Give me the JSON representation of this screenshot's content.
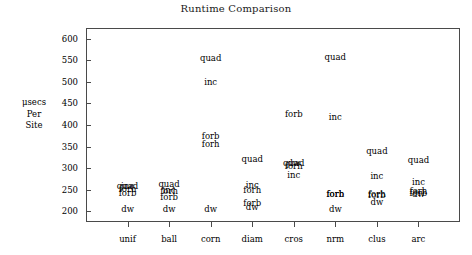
{
  "chart_data": {
    "type": "scatter",
    "title": "Runtime Comparison",
    "xlabel": "",
    "ylabel": "μsecs Per Site",
    "ylabel_lines": [
      "μsecs",
      "Per",
      "Site"
    ],
    "categories": [
      "unif",
      "ball",
      "corn",
      "diam",
      "cros",
      "nrm",
      "clus",
      "arc"
    ],
    "yticks": [
      200,
      250,
      300,
      350,
      400,
      450,
      500,
      550,
      600
    ],
    "ylim": [
      175,
      625
    ],
    "grid": false,
    "legend": "none",
    "marker_style": "text-label",
    "series": [
      {
        "name": "quad",
        "values": [
          258,
          262,
          555,
          320,
          312,
          558,
          340,
          318
        ]
      },
      {
        "name": "inc",
        "values": [
          258,
          250,
          500,
          260,
          285,
          418,
          282,
          268
        ]
      },
      {
        "name": "forb",
        "values": [
          243,
          234,
          375,
          218,
          308,
          240,
          238,
          242
        ]
      },
      {
        "name": "forh",
        "values": [
          252,
          246,
          355,
          250,
          306,
          240,
          240,
          248
        ]
      },
      {
        "name": "dw",
        "values": [
          205,
          204,
          204,
          210,
          312,
          205,
          222,
          240
        ]
      }
    ],
    "points": [
      {
        "category": "unif",
        "series": "quad",
        "value": 258
      },
      {
        "category": "unif",
        "series": "inc",
        "value": 258
      },
      {
        "category": "unif",
        "series": "forh",
        "value": 252
      },
      {
        "category": "unif",
        "series": "forb",
        "value": 243
      },
      {
        "category": "unif",
        "series": "dw",
        "value": 205
      },
      {
        "category": "ball",
        "series": "quad",
        "value": 262
      },
      {
        "category": "ball",
        "series": "inc",
        "value": 250
      },
      {
        "category": "ball",
        "series": "forh",
        "value": 246
      },
      {
        "category": "ball",
        "series": "forb",
        "value": 234
      },
      {
        "category": "ball",
        "series": "dw",
        "value": 204
      },
      {
        "category": "corn",
        "series": "quad",
        "value": 555
      },
      {
        "category": "corn",
        "series": "inc",
        "value": 500
      },
      {
        "category": "corn",
        "series": "forb",
        "value": 375
      },
      {
        "category": "corn",
        "series": "forh",
        "value": 355
      },
      {
        "category": "corn",
        "series": "dw",
        "value": 204
      },
      {
        "category": "diam",
        "series": "quad",
        "value": 320
      },
      {
        "category": "diam",
        "series": "inc",
        "value": 260
      },
      {
        "category": "diam",
        "series": "forh",
        "value": 250
      },
      {
        "category": "diam",
        "series": "forb",
        "value": 218
      },
      {
        "category": "diam",
        "series": "dw",
        "value": 210
      },
      {
        "category": "cros",
        "series": "forb",
        "value": 425
      },
      {
        "category": "cros",
        "series": "quad",
        "value": 312
      },
      {
        "category": "cros",
        "series": "dw",
        "value": 312
      },
      {
        "category": "cros",
        "series": "forh",
        "value": 306
      },
      {
        "category": "cros",
        "series": "inc",
        "value": 285
      },
      {
        "category": "nrm",
        "series": "quad",
        "value": 558
      },
      {
        "category": "nrm",
        "series": "inc",
        "value": 418
      },
      {
        "category": "nrm",
        "series": "forb",
        "value": 240
      },
      {
        "category": "nrm",
        "series": "forh",
        "value": 240
      },
      {
        "category": "nrm",
        "series": "dw",
        "value": 205
      },
      {
        "category": "clus",
        "series": "quad",
        "value": 340
      },
      {
        "category": "clus",
        "series": "inc",
        "value": 282
      },
      {
        "category": "clus",
        "series": "forh",
        "value": 240
      },
      {
        "category": "clus",
        "series": "forb",
        "value": 238
      },
      {
        "category": "clus",
        "series": "dw",
        "value": 222
      },
      {
        "category": "arc",
        "series": "quad",
        "value": 318
      },
      {
        "category": "arc",
        "series": "inc",
        "value": 268
      },
      {
        "category": "arc",
        "series": "forh",
        "value": 248
      },
      {
        "category": "arc",
        "series": "forb",
        "value": 242
      },
      {
        "category": "arc",
        "series": "dw",
        "value": 240
      }
    ]
  }
}
